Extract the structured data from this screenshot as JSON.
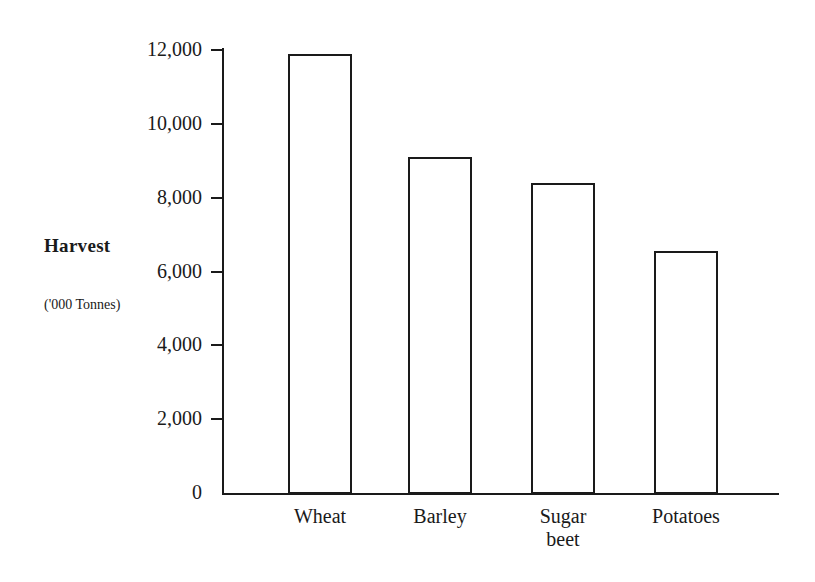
{
  "chart_data": {
    "type": "bar",
    "title": "",
    "subtitle": "",
    "xlabel": "",
    "ylabel": "Harvest",
    "ylabel_units": "('000 Tonnes)",
    "categories": [
      "Wheat",
      "Barley",
      "Sugar beet",
      "Potatoes"
    ],
    "values": [
      11900,
      9100,
      8400,
      6550
    ],
    "ylim": [
      0,
      12000
    ],
    "ytick_values": [
      0,
      2000,
      4000,
      6000,
      8000,
      10000,
      12000
    ],
    "ytick_labels": [
      "0",
      "2,000",
      "4,000",
      "6,000",
      "8,000",
      "10,000",
      "12,000"
    ],
    "grid": false,
    "legend": false,
    "bar_fill_color": "#ffffff",
    "bar_edge_color": "#1a1a1a",
    "axis_color": "#1a1a1a",
    "background_color": "#ffffff"
  },
  "axis_titles": {
    "harvest": "Harvest",
    "units": "('000 Tonnes)"
  },
  "y_ticks": [
    {
      "label": "12,000",
      "value": 12000
    },
    {
      "label": "10,000",
      "value": 10000
    },
    {
      "label": "8,000",
      "value": 8000
    },
    {
      "label": "6,000",
      "value": 6000
    },
    {
      "label": "4,000",
      "value": 4000
    },
    {
      "label": "2,000",
      "value": 2000
    },
    {
      "label": "0",
      "value": 0
    }
  ],
  "bars": [
    {
      "label": "Wheat",
      "value": 11900
    },
    {
      "label": "Barley",
      "value": 9100
    },
    {
      "label": "Sugar\nbeet",
      "value": 8400
    },
    {
      "label": "Potatoes",
      "value": 6550
    }
  ]
}
